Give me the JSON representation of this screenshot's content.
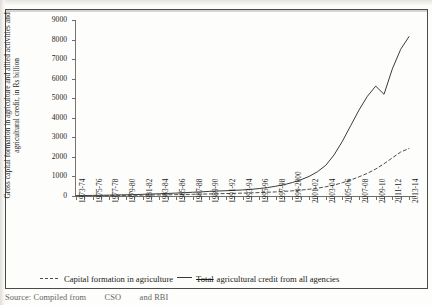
{
  "figure": {
    "y_axis_title": "Gross capital formation in agriculture and allied activities and agricultural credit, in Rs billion",
    "source_note_part1": "Source: Compiled from",
    "source_note_part2": "CSO",
    "source_note_part3": "and RBI"
  },
  "legend": {
    "series1_label": "Capital formation in agriculture",
    "series2_label_struck": "Total",
    "series2_label": "agricultural credit from all agencies"
  },
  "chart_data": {
    "type": "line",
    "title": "",
    "xlabel": "",
    "ylabel": "Gross capital formation in agriculture and allied activities and agricultural credit, in Rs billion",
    "ylim": [
      0,
      9000
    ],
    "ytick_labels": [
      "9000",
      "8000",
      "7000",
      "6000",
      "5000",
      "4000",
      "3000",
      "2000",
      "1000",
      "0"
    ],
    "ytick_values": [
      9000,
      8000,
      7000,
      6000,
      5000,
      4000,
      3000,
      2000,
      1000,
      0
    ],
    "grid": false,
    "legend_position": "bottom-left",
    "categories": [
      "1973-74",
      "1974-75",
      "1975-76",
      "1976-77",
      "1977-78",
      "1978-79",
      "1979-80",
      "1980-81",
      "1981-82",
      "1982-83",
      "1983-84",
      "1984-85",
      "1985-86",
      "1986-87",
      "1987-88",
      "1988-89",
      "1989-90",
      "1990-91",
      "1991-92",
      "1992-93",
      "1993-94",
      "1994-95",
      "1995-96",
      "1996-97",
      "1997-98",
      "1998-99",
      "1999-2000",
      "2000-01",
      "2001-02",
      "2002-03",
      "2003-04",
      "2004-05",
      "2005-06",
      "2006-07",
      "2007-08",
      "2008-09",
      "2009-10",
      "2010-11",
      "2011-12",
      "2012-13",
      "2013-14"
    ],
    "xtick_labels": [
      "1973-74",
      "1975-76",
      "1977-78",
      "1979-80",
      "1981-82",
      "1983-84",
      "1985-86",
      "1987-88",
      "1989-90",
      "1991-92",
      "1993-94",
      "1995-96",
      "1997-98",
      "1999-2000",
      "2001-02",
      "2003-04",
      "2005-06",
      "2007-08",
      "2009-10",
      "2011-12",
      "2013-14"
    ],
    "series": [
      {
        "name": "Total agricultural credit from all agencies",
        "style": "solid",
        "color": "#3b3b39",
        "values": [
          20,
          25,
          30,
          36,
          44,
          52,
          62,
          72,
          85,
          100,
          115,
          130,
          150,
          170,
          190,
          210,
          235,
          255,
          270,
          290,
          310,
          340,
          380,
          430,
          500,
          580,
          690,
          830,
          1000,
          1240,
          1570,
          2100,
          2800,
          3600,
          4400,
          5100,
          5620,
          5200,
          6500,
          7500,
          8150
        ]
      },
      {
        "name": "Capital formation in agriculture",
        "style": "dashed",
        "color": "#4d4d4b",
        "values": [
          15,
          18,
          20,
          23,
          26,
          30,
          34,
          38,
          44,
          50,
          56,
          62,
          70,
          78,
          86,
          95,
          105,
          115,
          125,
          135,
          148,
          160,
          175,
          190,
          210,
          235,
          265,
          300,
          345,
          400,
          470,
          560,
          680,
          820,
          980,
          1160,
          1380,
          1650,
          1950,
          2250,
          2430
        ]
      }
    ]
  }
}
